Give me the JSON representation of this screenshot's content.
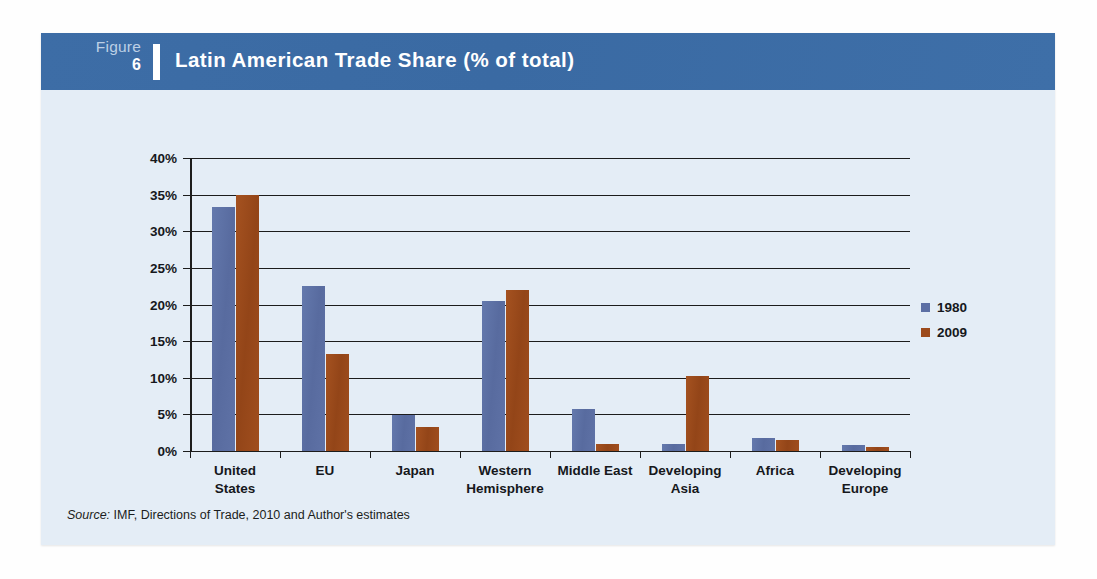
{
  "figure": {
    "label_word": "Figure",
    "number": "6",
    "title": "Latin American Trade Share (% of total)",
    "header_color": "#3a6ba5",
    "card_background": "#e4edf6"
  },
  "source": {
    "label": "Source:",
    "text": "IMF, Directions of Trade, 2010 and Author's estimates"
  },
  "legend": {
    "position": "right",
    "entries": [
      {
        "name": "1980",
        "color": "#5c6fa4"
      },
      {
        "name": "2009",
        "color": "#9c4a1c"
      }
    ]
  },
  "chart_data": {
    "type": "bar",
    "title": "Latin American Trade Share (% of total)",
    "xlabel": "",
    "ylabel": "",
    "ylim": [
      0,
      40
    ],
    "ytick_step": 5,
    "ytick_labels": [
      "0%",
      "5%",
      "10%",
      "15%",
      "20%",
      "25%",
      "30%",
      "35%",
      "40%"
    ],
    "ytick_values": [
      0,
      5,
      10,
      15,
      20,
      25,
      30,
      35,
      40
    ],
    "grid": true,
    "grid_axis": "y",
    "legend_position": "right",
    "unit": "%",
    "categories": [
      "United States",
      "EU",
      "Japan",
      "Western Hemisphere",
      "Middle East",
      "Developing Asia",
      "Africa",
      "Developing Europe"
    ],
    "category_label_lines": [
      [
        "United",
        "States"
      ],
      [
        "EU",
        ""
      ],
      [
        "Japan",
        ""
      ],
      [
        "Western",
        "Hemisphere"
      ],
      [
        "Middle East",
        ""
      ],
      [
        "Developing",
        "Asia"
      ],
      [
        "Africa",
        ""
      ],
      [
        "Developing",
        "Europe"
      ]
    ],
    "series": [
      {
        "name": "1980",
        "color": "#5c6fa4",
        "values": [
          33.3,
          22.5,
          4.9,
          20.5,
          5.8,
          1.0,
          1.8,
          0.8
        ]
      },
      {
        "name": "2009",
        "color": "#9c4a1c",
        "values": [
          35.0,
          13.3,
          3.3,
          22.0,
          1.0,
          10.2,
          1.5,
          0.5
        ]
      }
    ]
  }
}
